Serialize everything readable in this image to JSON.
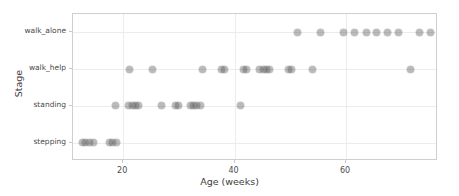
{
  "chart_data": {
    "type": "scatter",
    "title": "",
    "xlabel": "Age (weeks)",
    "ylabel": "Stage",
    "xlim": [
      11.0,
      76.5
    ],
    "xticks": [
      20,
      40,
      60
    ],
    "xtick_labels": [
      "20",
      "40",
      "60"
    ],
    "categories": [
      "stepping",
      "standing",
      "walk_help",
      "walk_alone"
    ],
    "ytick_labels": [
      "walk_alone",
      "walk_help",
      "standing",
      "stepping"
    ],
    "grid": true,
    "legend": null,
    "marker": {
      "shape": "circle",
      "color": "#5a5a5a",
      "alpha": 0.42,
      "size": 7
    },
    "points": [
      {
        "x": 12.7,
        "y": "stepping"
      },
      {
        "x": 13.3,
        "y": "stepping"
      },
      {
        "x": 13.9,
        "y": "stepping"
      },
      {
        "x": 14.6,
        "y": "stepping"
      },
      {
        "x": 17.5,
        "y": "stepping"
      },
      {
        "x": 18.1,
        "y": "stepping"
      },
      {
        "x": 18.8,
        "y": "stepping"
      },
      {
        "x": 18.7,
        "y": "standing"
      },
      {
        "x": 21.0,
        "y": "standing"
      },
      {
        "x": 21.6,
        "y": "standing"
      },
      {
        "x": 22.2,
        "y": "standing"
      },
      {
        "x": 22.8,
        "y": "standing"
      },
      {
        "x": 26.9,
        "y": "standing"
      },
      {
        "x": 29.4,
        "y": "standing"
      },
      {
        "x": 30.0,
        "y": "standing"
      },
      {
        "x": 32.0,
        "y": "standing"
      },
      {
        "x": 32.6,
        "y": "standing"
      },
      {
        "x": 33.2,
        "y": "standing"
      },
      {
        "x": 33.8,
        "y": "standing"
      },
      {
        "x": 41.0,
        "y": "standing"
      },
      {
        "x": 21.2,
        "y": "walk_help"
      },
      {
        "x": 25.3,
        "y": "walk_help"
      },
      {
        "x": 34.3,
        "y": "walk_help"
      },
      {
        "x": 37.6,
        "y": "walk_help"
      },
      {
        "x": 38.2,
        "y": "walk_help"
      },
      {
        "x": 41.6,
        "y": "walk_help"
      },
      {
        "x": 42.2,
        "y": "walk_help"
      },
      {
        "x": 44.5,
        "y": "walk_help"
      },
      {
        "x": 45.1,
        "y": "walk_help"
      },
      {
        "x": 45.7,
        "y": "walk_help"
      },
      {
        "x": 46.3,
        "y": "walk_help"
      },
      {
        "x": 49.6,
        "y": "walk_help"
      },
      {
        "x": 50.2,
        "y": "walk_help"
      },
      {
        "x": 54.0,
        "y": "walk_help"
      },
      {
        "x": 71.6,
        "y": "walk_help"
      },
      {
        "x": 51.2,
        "y": "walk_alone"
      },
      {
        "x": 55.5,
        "y": "walk_alone"
      },
      {
        "x": 59.6,
        "y": "walk_alone"
      },
      {
        "x": 61.6,
        "y": "walk_alone"
      },
      {
        "x": 63.6,
        "y": "walk_alone"
      },
      {
        "x": 65.5,
        "y": "walk_alone"
      },
      {
        "x": 67.5,
        "y": "walk_alone"
      },
      {
        "x": 69.4,
        "y": "walk_alone"
      },
      {
        "x": 73.2,
        "y": "walk_alone"
      },
      {
        "x": 75.2,
        "y": "walk_alone"
      }
    ]
  },
  "axes": {
    "x_title": "Age (weeks)",
    "y_title": "Stage"
  }
}
